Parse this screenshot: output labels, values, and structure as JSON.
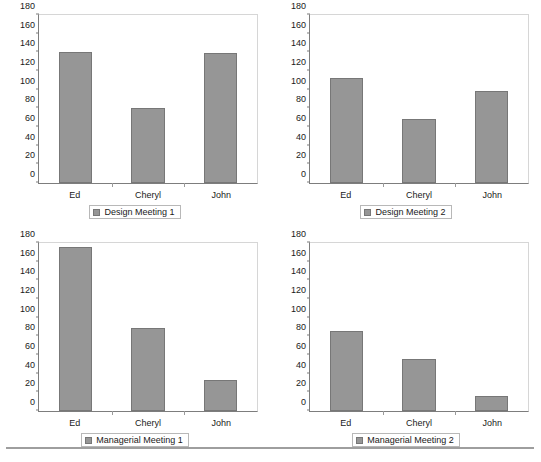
{
  "figure": {
    "background_color": "#ffffff",
    "bar_color": "#969696",
    "bar_edge_color": "#777777",
    "axis_color": "#7d7d7d"
  },
  "footer": {
    "caption": ""
  },
  "chart_data": [
    {
      "type": "bar",
      "title": "",
      "legend_label": "Design Meeting 1",
      "legend_position": "bottom-center",
      "categories": [
        "Ed",
        "Cheryl",
        "John"
      ],
      "values": [
        140,
        80,
        139
      ],
      "xlabel": "",
      "ylabel": "",
      "ylim": [
        0,
        180
      ],
      "yticks": [
        0,
        20,
        40,
        60,
        80,
        100,
        120,
        140,
        160,
        180
      ],
      "grid": false
    },
    {
      "type": "bar",
      "title": "",
      "legend_label": "Design Meeting 2",
      "legend_position": "bottom-center",
      "categories": [
        "Ed",
        "Cheryl",
        "John"
      ],
      "values": [
        113,
        69,
        99
      ],
      "xlabel": "",
      "ylabel": "",
      "ylim": [
        0,
        180
      ],
      "yticks": [
        0,
        20,
        40,
        60,
        80,
        100,
        120,
        140,
        160,
        180
      ],
      "grid": false
    },
    {
      "type": "bar",
      "title": "",
      "legend_label": "Managerial Meeting 1",
      "legend_position": "bottom-center",
      "categories": [
        "Ed",
        "Cheryl",
        "John"
      ],
      "values": [
        176,
        89,
        33
      ],
      "xlabel": "",
      "ylabel": "",
      "ylim": [
        0,
        180
      ],
      "yticks": [
        0,
        20,
        40,
        60,
        80,
        100,
        120,
        140,
        160,
        180
      ],
      "grid": false
    },
    {
      "type": "bar",
      "title": "",
      "legend_label": "Managerial Meeting 2",
      "legend_position": "bottom-center",
      "categories": [
        "Ed",
        "Cheryl",
        "John"
      ],
      "values": [
        86,
        56,
        16
      ],
      "xlabel": "",
      "ylabel": "",
      "ylim": [
        0,
        180
      ],
      "yticks": [
        0,
        20,
        40,
        60,
        80,
        100,
        120,
        140,
        160,
        180
      ],
      "grid": false
    }
  ]
}
